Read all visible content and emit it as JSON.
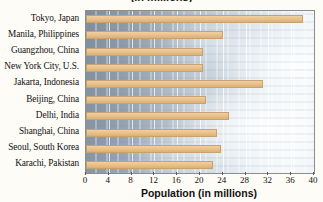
{
  "chart_data": {
    "type": "bar",
    "orientation": "horizontal",
    "title": "(in millions)",
    "xlabel": "Population (in millions)",
    "ylabel": "",
    "xlim": [
      0,
      40
    ],
    "xticks": [
      0,
      4,
      8,
      12,
      16,
      20,
      24,
      28,
      32,
      36,
      40
    ],
    "xtick_labels": [
      "0",
      "4",
      "8",
      "12",
      "16",
      "20",
      "24",
      "28",
      "32",
      "36",
      "40"
    ],
    "grid": true,
    "legend": false,
    "bar_color": "#E9C28D",
    "categories": [
      "Tokyo, Japan",
      "Manila, Philippines",
      "Guangzhou, China",
      "New York City, U.S.",
      "Jakarta, Indonesia",
      "Beijing, China",
      "Delhi, India",
      "Shanghai, China",
      "Seoul, South Korea",
      "Karachi, Pakistan"
    ],
    "values": [
      38.0,
      24.0,
      20.5,
      20.5,
      31.0,
      21.0,
      25.0,
      23.0,
      23.7,
      22.3
    ]
  },
  "axis": {
    "x_title": "Population (in millions)"
  }
}
